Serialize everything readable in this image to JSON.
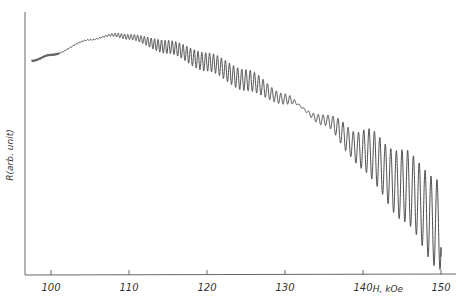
{
  "chart_data": {
    "type": "line",
    "title": "",
    "xlabel": "H, kOe",
    "ylabel": "R(arb. unit)",
    "xlim": [
      97,
      152
    ],
    "ylim": [
      0,
      100
    ],
    "grid": false,
    "legend": null,
    "x_ticks": [
      100,
      110,
      120,
      130,
      140,
      150
    ],
    "x_tick_labels": [
      "100",
      "110",
      "120",
      "130",
      "140",
      "150"
    ],
    "y_ticks": [],
    "series": [
      {
        "name": "R(H) background trend",
        "x": [
          97.5,
          100,
          105,
          108,
          110,
          115,
          120,
          125,
          130,
          135,
          140,
          145,
          150
        ],
        "values": [
          81.4,
          83.7,
          89.4,
          91.3,
          90.5,
          86.7,
          81.0,
          74.1,
          66.9,
          58.9,
          47.5,
          34.2,
          19.0
        ]
      },
      {
        "name": "Shubnikov-de Haas oscillation half-amplitude",
        "x": [
          97.5,
          106,
          110,
          115,
          120,
          125,
          130,
          132,
          135,
          138,
          142,
          146,
          150
        ],
        "values": [
          0,
          0.2,
          1.0,
          2.5,
          3.5,
          4.0,
          2.0,
          0.3,
          2.0,
          5.0,
          10.0,
          14.0,
          17.0
        ]
      }
    ],
    "oscillation": {
      "frequency_kOe": 29000,
      "cycles_approx": 65
    },
    "annotations": []
  },
  "axes": {
    "x_label": "H, kOe",
    "y_label": "R(arb. unit)"
  },
  "colors": {
    "curve": "#3a3a3a",
    "axis": "#555555",
    "background": "#ffffff"
  }
}
